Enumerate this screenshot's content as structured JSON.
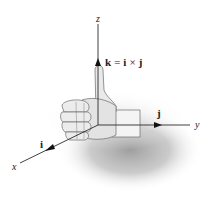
{
  "figure": {
    "axes": {
      "x": {
        "label": "x",
        "unit_vector": "i"
      },
      "y": {
        "label": "y",
        "unit_vector": "j"
      },
      "z": {
        "label": "z",
        "unit_vector": "k"
      }
    },
    "equation": {
      "lhs": "k",
      "eq": "=",
      "a": "i",
      "op": "×",
      "b": "j"
    },
    "colors": {
      "axis": "#2a2a2a",
      "hand_fill": "#e6e6e6",
      "hand_stroke": "#6a6a6a",
      "shadow": "#9a9a9a"
    }
  }
}
